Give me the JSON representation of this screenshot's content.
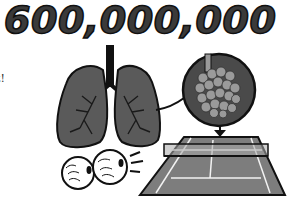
{
  "headline": "600,000,000",
  "clipped_text_fragment": "t!",
  "illustration": {
    "elements": [
      "lungs",
      "alveoli-magnified-circle",
      "down-arrow",
      "tennis-court",
      "tennis-balls"
    ],
    "colors": {
      "outline": "#111111",
      "lung_fill": "#5a5a5a",
      "alveoli_bg": "#4a4a4a",
      "alveoli_fill": "#9a9a9a",
      "court_fill": "#7d7d7d",
      "court_lines": "#f2f2f2",
      "background": "#ffffff"
    }
  }
}
